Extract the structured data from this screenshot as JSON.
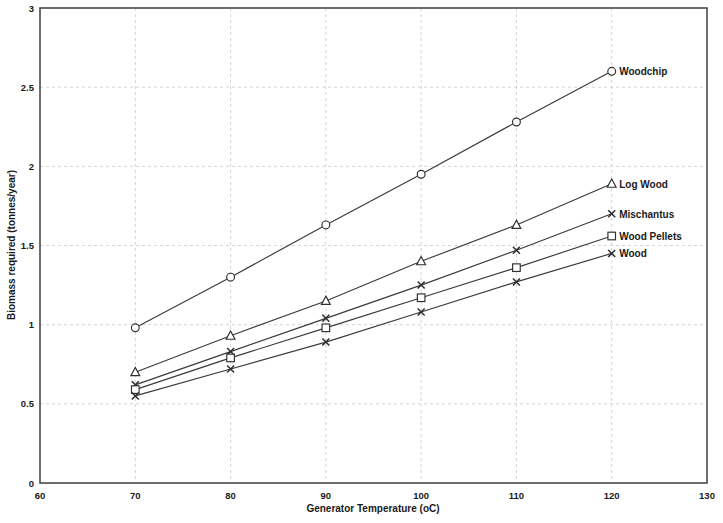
{
  "chart_data": {
    "type": "line",
    "title": "",
    "xlabel": "Generator Temperature (oC)",
    "ylabel": "Biomass required (tonnes/year)",
    "x": [
      70,
      80,
      90,
      100,
      110,
      120
    ],
    "xlim": [
      60,
      130
    ],
    "ylim": [
      0,
      3
    ],
    "xticks": [
      "60",
      "70",
      "80",
      "90",
      "100",
      "110",
      "120",
      "130"
    ],
    "yticks": [
      "0",
      "0.5",
      "1",
      "1.5",
      "2",
      "2.5",
      "3"
    ],
    "grid": true,
    "legend_position": "inline-right-end-labels",
    "series": [
      {
        "name": "Woodchip",
        "marker": "circle",
        "values": [
          0.98,
          1.3,
          1.63,
          1.95,
          2.28,
          2.6
        ]
      },
      {
        "name": "Log  Wood",
        "marker": "triangle",
        "values": [
          0.7,
          0.93,
          1.15,
          1.4,
          1.63,
          1.89
        ]
      },
      {
        "name": "Mischantus",
        "marker": "x",
        "values": [
          0.62,
          0.83,
          1.04,
          1.25,
          1.47,
          1.7
        ]
      },
      {
        "name": "Wood Pellets",
        "marker": "square",
        "values": [
          0.59,
          0.79,
          0.98,
          1.17,
          1.36,
          1.56
        ]
      },
      {
        "name": "Wood",
        "marker": "x",
        "values": [
          0.55,
          0.72,
          0.89,
          1.08,
          1.27,
          1.45
        ]
      }
    ]
  }
}
